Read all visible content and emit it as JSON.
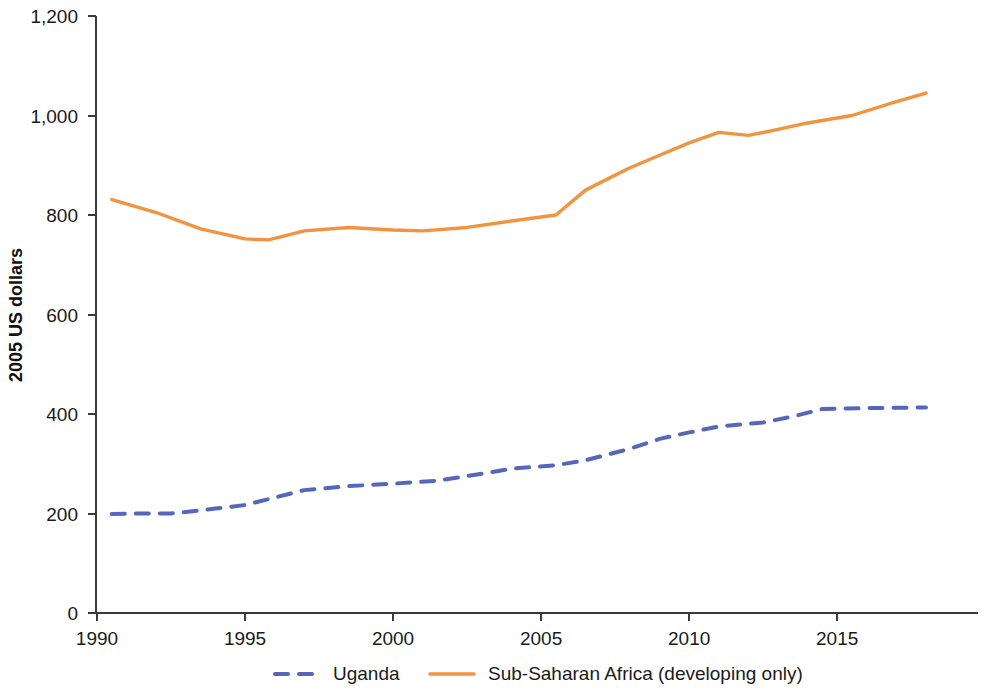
{
  "chart_data": {
    "type": "line",
    "title": "",
    "subtitle": "",
    "xlabel": "",
    "ylabel": "2005 US dollars",
    "xlim": [
      1990,
      2018
    ],
    "ylim": [
      0,
      1200
    ],
    "grid": false,
    "legend_position": "bottom",
    "x_ticks": [
      "1990",
      "1995",
      "2000",
      "2005",
      "2010",
      "2015"
    ],
    "x_tick_values": [
      1990,
      1995,
      2000,
      2005,
      2010,
      2015
    ],
    "y_ticks": [
      "0",
      "200",
      "400",
      "600",
      "800",
      "1,000",
      "1,200"
    ],
    "y_tick_values": [
      0,
      200,
      400,
      600,
      800,
      1000,
      1200
    ],
    "series": [
      {
        "name": "Uganda",
        "color": "#5566BB",
        "style": "dashed",
        "x": [
          1990.5,
          1991.5,
          1992.5,
          1993,
          1994,
          1995,
          1996,
          1997,
          1998.5,
          2000,
          2001.5,
          2003,
          2004,
          2005.5,
          2006.5,
          2008,
          2009,
          2010,
          2011,
          2012.5,
          2013.5,
          2014.5,
          2016,
          2018
        ],
        "values": [
          199,
          200,
          200,
          203,
          210,
          217,
          232,
          247,
          255,
          260,
          266,
          280,
          290,
          297,
          307,
          330,
          350,
          363,
          375,
          383,
          395,
          410,
          412,
          413
        ]
      },
      {
        "name": "Sub-Saharan Africa (developing only)",
        "color": "#F2943F",
        "style": "solid",
        "x": [
          1990.5,
          1992,
          1993.5,
          1995,
          1995.8,
          1997,
          1998.5,
          2000,
          2001,
          2002.5,
          2004,
          2005.5,
          2006.5,
          2008,
          2009,
          2010,
          2011,
          2012,
          2013,
          2014,
          2015.5,
          2017,
          2018
        ],
        "values": [
          831,
          805,
          772,
          752,
          750,
          768,
          775,
          770,
          768,
          775,
          788,
          800,
          850,
          895,
          920,
          945,
          966,
          960,
          972,
          985,
          1000,
          1028,
          1045
        ]
      }
    ]
  },
  "axis": {
    "y_title": "2005 US dollars"
  },
  "legend": {
    "items": [
      {
        "label": "Uganda",
        "color": "#5566BB",
        "style": "dashed"
      },
      {
        "label": "Sub-Saharan Africa (developing only)",
        "color": "#F2943F",
        "style": "solid"
      }
    ]
  }
}
